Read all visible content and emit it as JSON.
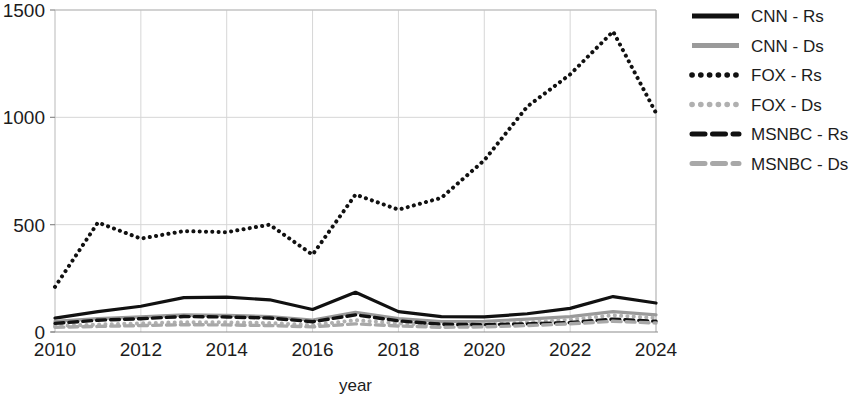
{
  "chart_data": {
    "type": "line",
    "title": "",
    "xlabel": "year",
    "ylabel": "",
    "xlim": [
      2010,
      2024
    ],
    "ylim": [
      0,
      1500
    ],
    "ytick_labels": [
      "0",
      "500",
      "1000",
      "1500"
    ],
    "ytick_values": [
      0,
      500,
      1000,
      1500
    ],
    "xtick_labels": [
      "2010",
      "2012",
      "2014",
      "2016",
      "2018",
      "2020",
      "2022",
      "2024"
    ],
    "xtick_values": [
      2010,
      2012,
      2014,
      2016,
      2018,
      2020,
      2022,
      2024
    ],
    "grid": true,
    "legend_position": "right",
    "x": [
      2010,
      2011,
      2012,
      2013,
      2014,
      2015,
      2016,
      2017,
      2018,
      2019,
      2020,
      2021,
      2022,
      2023,
      2024
    ],
    "series": [
      {
        "name": "CNN - Rs",
        "color": "#111111",
        "style": "solid",
        "width": 3.2,
        "values": [
          65,
          95,
          120,
          160,
          162,
          150,
          105,
          185,
          95,
          72,
          70,
          85,
          110,
          165,
          135
        ]
      },
      {
        "name": "CNN - Ds",
        "color": "#9a9a9a",
        "style": "solid",
        "width": 3.2,
        "values": [
          50,
          62,
          70,
          80,
          78,
          72,
          55,
          92,
          62,
          48,
          50,
          60,
          72,
          95,
          80
        ]
      },
      {
        "name": "FOX - Rs",
        "color": "#111111",
        "style": "dotted",
        "width": 4.0,
        "values": [
          210,
          510,
          435,
          470,
          465,
          500,
          360,
          640,
          570,
          625,
          800,
          1050,
          1200,
          1400,
          1020
        ]
      },
      {
        "name": "FOX - Ds",
        "color": "#b0b0b0",
        "style": "dotted",
        "width": 4.0,
        "values": [
          28,
          35,
          40,
          46,
          45,
          42,
          32,
          55,
          40,
          33,
          35,
          45,
          58,
          78,
          65
        ]
      },
      {
        "name": "MSNBC - Rs",
        "color": "#111111",
        "style": "dashed",
        "width": 3.4,
        "values": [
          40,
          55,
          62,
          72,
          70,
          65,
          48,
          80,
          52,
          36,
          34,
          38,
          44,
          60,
          50
        ]
      },
      {
        "name": "MSNBC - Ds",
        "color": "#a8a8a8",
        "style": "dashed",
        "width": 3.4,
        "values": [
          22,
          26,
          30,
          34,
          33,
          30,
          24,
          38,
          28,
          22,
          24,
          30,
          38,
          50,
          42
        ]
      }
    ]
  },
  "legend": {
    "entries": [
      {
        "label": "CNN - Rs"
      },
      {
        "label": "CNN - Ds"
      },
      {
        "label": "FOX - Rs"
      },
      {
        "label": "FOX - Ds"
      },
      {
        "label": "MSNBC - Rs"
      },
      {
        "label": "MSNBC - Ds"
      }
    ]
  }
}
